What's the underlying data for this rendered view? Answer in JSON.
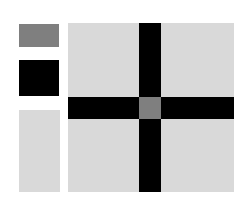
{
  "colors": {
    "gray": "#7f7f7f",
    "black": "#000000",
    "light": "#d9d9d9",
    "panel": "#d9d9d9",
    "bar": "#000000",
    "center": "#7f7f7f"
  },
  "swatches": [
    {
      "name": "gray-swatch",
      "color": "#7f7f7f"
    },
    {
      "name": "black-swatch",
      "color": "#000000"
    },
    {
      "name": "light-swatch",
      "color": "#d9d9d9"
    }
  ],
  "panel": {
    "background": "#d9d9d9",
    "cross_color": "#000000",
    "center_color": "#7f7f7f"
  }
}
